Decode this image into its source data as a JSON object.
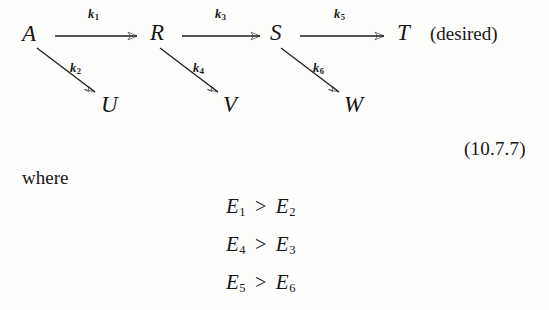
{
  "document": {
    "equation_number": "(10.7.7)",
    "where_label": "where",
    "desired_label": "(desired)"
  },
  "scheme": {
    "chain_species": [
      {
        "label": "A"
      },
      {
        "label": "R"
      },
      {
        "label": "S"
      },
      {
        "label": "T"
      }
    ],
    "byproduct_species": [
      {
        "label": "U"
      },
      {
        "label": "V"
      },
      {
        "label": "W"
      }
    ],
    "horizontal_rate_constants": [
      {
        "symbol": "k",
        "index": "1"
      },
      {
        "symbol": "k",
        "index": "3"
      },
      {
        "symbol": "k",
        "index": "5"
      }
    ],
    "diagonal_rate_constants": [
      {
        "symbol": "k",
        "index": "2"
      },
      {
        "symbol": "k",
        "index": "4"
      },
      {
        "symbol": "k",
        "index": "6"
      }
    ]
  },
  "inequalities": [
    {
      "left_symbol": "E",
      "left_index": "1",
      "relation": ">",
      "right_symbol": "E",
      "right_index": "2"
    },
    {
      "left_symbol": "E",
      "left_index": "4",
      "relation": ">",
      "right_symbol": "E",
      "right_index": "3"
    },
    {
      "left_symbol": "E",
      "left_index": "5",
      "relation": ">",
      "right_symbol": "E",
      "right_index": "6"
    }
  ]
}
